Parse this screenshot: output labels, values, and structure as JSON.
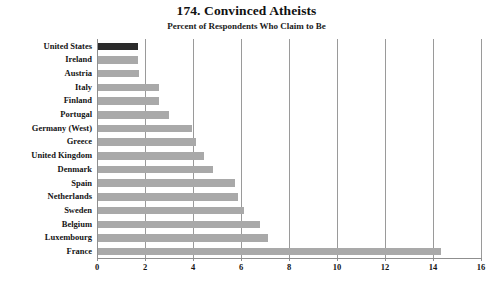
{
  "chart_data": {
    "type": "bar",
    "orientation": "horizontal",
    "title": "174. Convinced Atheists",
    "subtitle": "Percent of Respondents Who Claim to Be",
    "xlabel": "",
    "ylabel": "",
    "xlim": [
      0,
      16
    ],
    "xticks": [
      0,
      2,
      4,
      6,
      8,
      10,
      12,
      14,
      16
    ],
    "grid": "vertical",
    "legend": "none",
    "highlight_category": "United States",
    "colors": {
      "bar": "#a9a9a9",
      "highlight_bar": "#2b2b2b",
      "gridline": "#9a9a9a",
      "axis": "#8f8f8f",
      "text": "#141414",
      "background": "#ffffff"
    },
    "categories": [
      "United States",
      "Ireland",
      "Austria",
      "Italy",
      "Finland",
      "Portugal",
      "Germany (West)",
      "Greece",
      "United Kingdom",
      "Denmark",
      "Spain",
      "Netherlands",
      "Sweden",
      "Belgium",
      "Luxembourg",
      "France"
    ],
    "values": [
      1.65,
      1.65,
      1.7,
      2.55,
      2.55,
      2.95,
      3.9,
      4.1,
      4.4,
      4.8,
      5.7,
      5.85,
      6.1,
      6.75,
      7.1,
      14.3
    ]
  }
}
